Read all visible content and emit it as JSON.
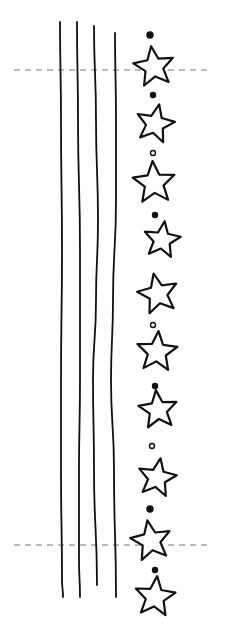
{
  "diagram": {
    "type": "embroidery-pattern",
    "width": 227,
    "height": 632,
    "stroke_color": "#111111",
    "guide_color": "#777777",
    "background": "#ffffff",
    "vertical_lines": [
      {
        "id": "line-1",
        "points": [
          [
            60,
            22
          ],
          [
            61,
            120
          ],
          [
            62,
            250
          ],
          [
            61,
            380
          ],
          [
            61,
            470
          ],
          [
            62,
            580
          ],
          [
            63,
            597
          ]
        ]
      },
      {
        "id": "line-2",
        "points": [
          [
            77,
            22
          ],
          [
            78,
            120
          ],
          [
            80,
            250
          ],
          [
            80,
            380
          ],
          [
            79,
            470
          ],
          [
            79,
            560
          ],
          [
            80,
            597
          ]
        ]
      },
      {
        "id": "line-3",
        "points": [
          [
            94,
            26
          ],
          [
            96,
            120
          ],
          [
            98,
            220
          ],
          [
            96,
            300
          ],
          [
            93,
            380
          ],
          [
            94,
            470
          ],
          [
            97,
            585
          ]
        ]
      },
      {
        "id": "line-4",
        "points": [
          [
            115,
            33
          ],
          [
            116,
            120
          ],
          [
            116,
            200
          ],
          [
            113,
            300
          ],
          [
            111,
            380
          ],
          [
            114,
            470
          ],
          [
            116,
            597
          ]
        ]
      }
    ],
    "guides": [
      {
        "id": "guide-top",
        "y": 70,
        "x1": 14,
        "x2": 210
      },
      {
        "id": "guide-bottom",
        "y": 545,
        "x1": 14,
        "x2": 210
      }
    ],
    "stars": [
      {
        "cx": 154,
        "cy": 67,
        "r": 21,
        "rot": -8
      },
      {
        "cx": 155,
        "cy": 124,
        "r": 20,
        "rot": 12
      },
      {
        "cx": 154,
        "cy": 183,
        "r": 22,
        "rot": -4
      },
      {
        "cx": 162,
        "cy": 240,
        "r": 19,
        "rot": 8
      },
      {
        "cx": 158,
        "cy": 294,
        "r": 21,
        "rot": -12
      },
      {
        "cx": 157,
        "cy": 352,
        "r": 21,
        "rot": 4
      },
      {
        "cx": 158,
        "cy": 410,
        "r": 20,
        "rot": -6
      },
      {
        "cx": 157,
        "cy": 478,
        "r": 20,
        "rot": 10
      },
      {
        "cx": 151,
        "cy": 541,
        "r": 21,
        "rot": -10
      },
      {
        "cx": 155,
        "cy": 597,
        "r": 21,
        "rot": 6
      }
    ],
    "dots": [
      {
        "cx": 150,
        "cy": 35,
        "r": 3,
        "filled": true
      },
      {
        "cx": 153,
        "cy": 95,
        "r": 2.5,
        "filled": true
      },
      {
        "cx": 153,
        "cy": 153,
        "r": 2.5,
        "filled": false
      },
      {
        "cx": 155,
        "cy": 215,
        "r": 2.5,
        "filled": true
      },
      {
        "cx": 153,
        "cy": 325,
        "r": 2.5,
        "filled": false
      },
      {
        "cx": 155,
        "cy": 386,
        "r": 2.5,
        "filled": true
      },
      {
        "cx": 152,
        "cy": 446,
        "r": 2.5,
        "filled": false
      },
      {
        "cx": 150,
        "cy": 509,
        "r": 3,
        "filled": true
      },
      {
        "cx": 155,
        "cy": 570,
        "r": 2.5,
        "filled": true
      }
    ]
  }
}
